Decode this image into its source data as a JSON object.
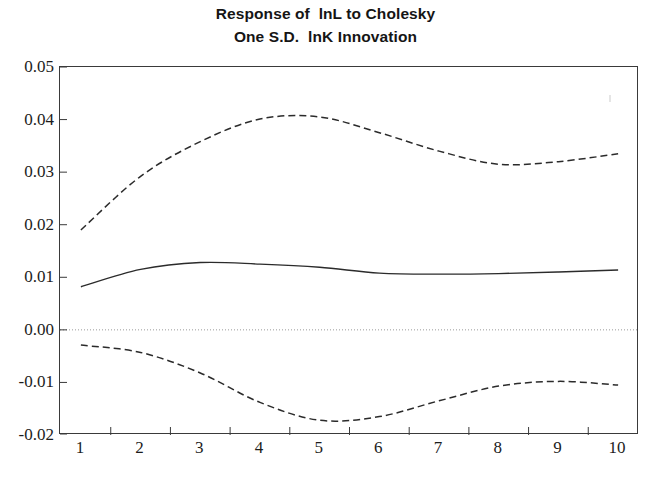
{
  "figure": {
    "title_line1": "Response of  lnL to Cholesky",
    "title_line2": "One S.D.  lnK Innovation",
    "background_color": "#ffffff",
    "frame_color": "#3a3a3a",
    "line_color": "#2b2b2b",
    "zero_line_color": "#9a9a9a"
  },
  "chart_data": {
    "type": "line",
    "title": "Response of lnL to Cholesky One S.D. lnK Innovation",
    "subtitle": "",
    "xlabel": "",
    "ylabel": "",
    "x": [
      1,
      2,
      3,
      4,
      5,
      6,
      7,
      8,
      9,
      10
    ],
    "xlim": [
      0.65,
      10.35
    ],
    "ylim": [
      -0.02,
      0.05
    ],
    "xticks": [
      "1",
      "2",
      "3",
      "4",
      "5",
      "6",
      "7",
      "8",
      "9",
      "10"
    ],
    "yticks": [
      "0.05",
      "0.04",
      "0.03",
      "0.02",
      "0.01",
      "0.00",
      "-0.01",
      "-0.02"
    ],
    "ytick_values": [
      0.05,
      0.04,
      0.03,
      0.02,
      0.01,
      0.0,
      -0.01,
      -0.02
    ],
    "grid": false,
    "zero_line": 0.0,
    "legend": [],
    "series": [
      {
        "name": "Impulse response",
        "style": "solid",
        "values": [
          0.0082,
          0.0115,
          0.0128,
          0.0125,
          0.0119,
          0.0108,
          0.0106,
          0.0107,
          0.011,
          0.0114
        ]
      },
      {
        "name": "Upper two S.E. band",
        "style": "dashed",
        "values": [
          0.019,
          0.0292,
          0.0358,
          0.0401,
          0.0405,
          0.0375,
          0.034,
          0.0315,
          0.032,
          0.0335
        ]
      },
      {
        "name": "Lower two S.E. band",
        "style": "dashed",
        "values": [
          -0.0029,
          -0.0043,
          -0.0082,
          -0.0138,
          -0.0172,
          -0.0165,
          -0.0135,
          -0.0107,
          -0.0098,
          -0.0105
        ]
      }
    ]
  }
}
